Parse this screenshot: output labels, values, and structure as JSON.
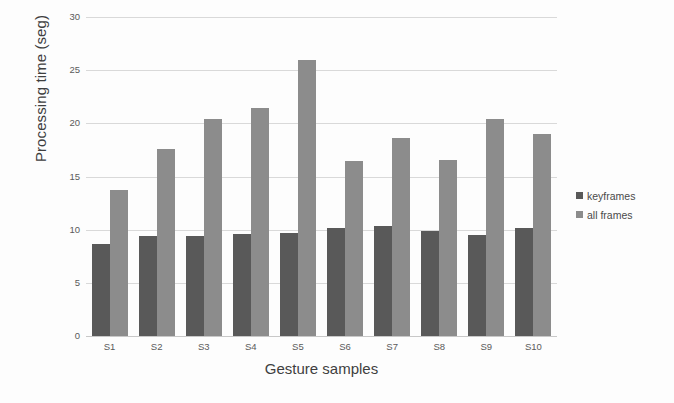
{
  "chart_data": {
    "type": "bar",
    "title": "",
    "xlabel": "Gesture samples",
    "ylabel": "Processing time (seg)",
    "categories": [
      "S1",
      "S2",
      "S3",
      "S4",
      "S5",
      "S6",
      "S7",
      "S8",
      "S9",
      "S10"
    ],
    "series": [
      {
        "name": "keyframes",
        "color": "#595959",
        "values": [
          8.7,
          9.4,
          9.4,
          9.6,
          9.7,
          10.2,
          10.3,
          9.9,
          9.5,
          10.2
        ]
      },
      {
        "name": "all frames",
        "color": "#8c8c8c",
        "values": [
          13.7,
          17.6,
          20.4,
          21.4,
          26.0,
          16.5,
          18.6,
          16.6,
          20.4,
          19.0
        ]
      }
    ],
    "ylim": [
      0,
      30
    ],
    "yticks": [
      0,
      5,
      10,
      15,
      20,
      25,
      30
    ],
    "ytick_labels": [
      "0",
      "5",
      "10",
      "15",
      "20",
      "25",
      "30"
    ],
    "grid": "horizontal",
    "legend_position": "right"
  },
  "legend": {
    "items": [
      {
        "label": "keyframes",
        "color": "#595959"
      },
      {
        "label": "all frames",
        "color": "#8c8c8c"
      }
    ]
  },
  "colors": {
    "keyframes": "#595959",
    "all_frames": "#8c8c8c",
    "gridline": "#d9d9d9",
    "text": "#4a4a4a",
    "background": "#fdfdfd"
  }
}
